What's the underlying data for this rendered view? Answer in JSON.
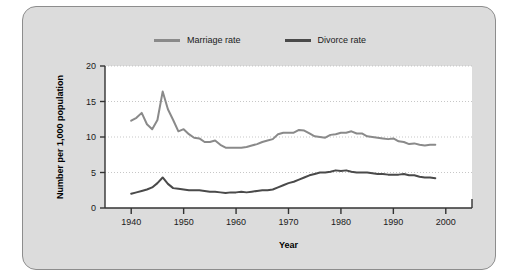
{
  "chart_data": {
    "type": "line",
    "title": "",
    "xlabel": "Year",
    "ylabel": "Number per 1,000 population",
    "xlim": [
      1935,
      2005
    ],
    "ylim": [
      0,
      20
    ],
    "xticks": [
      1940,
      1950,
      1960,
      1970,
      1980,
      1990,
      2000
    ],
    "yticks": [
      0,
      5,
      10,
      15,
      20
    ],
    "grid": "horizontal-dotted",
    "legend_position": "top-center",
    "series": [
      {
        "name": "Marriage rate",
        "color": "#8a8a8a",
        "x": [
          1940,
          1941,
          1942,
          1943,
          1944,
          1945,
          1946,
          1947,
          1948,
          1949,
          1950,
          1951,
          1952,
          1953,
          1954,
          1955,
          1956,
          1957,
          1958,
          1959,
          1960,
          1961,
          1962,
          1963,
          1964,
          1965,
          1966,
          1967,
          1968,
          1969,
          1970,
          1971,
          1972,
          1973,
          1974,
          1975,
          1976,
          1977,
          1978,
          1979,
          1980,
          1981,
          1982,
          1983,
          1984,
          1985,
          1986,
          1987,
          1988,
          1989,
          1990,
          1991,
          1992,
          1993,
          1994,
          1995,
          1996,
          1997,
          1998
        ],
        "values": [
          12.3,
          12.7,
          13.4,
          11.8,
          11.1,
          12.4,
          16.4,
          13.9,
          12.4,
          10.8,
          11.1,
          10.4,
          9.9,
          9.8,
          9.3,
          9.3,
          9.5,
          8.9,
          8.5,
          8.5,
          8.5,
          8.5,
          8.6,
          8.8,
          9.0,
          9.3,
          9.5,
          9.7,
          10.4,
          10.6,
          10.6,
          10.6,
          11.0,
          10.9,
          10.5,
          10.1,
          10.0,
          9.9,
          10.3,
          10.4,
          10.6,
          10.6,
          10.8,
          10.5,
          10.5,
          10.1,
          10.0,
          9.9,
          9.8,
          9.7,
          9.8,
          9.4,
          9.3,
          9.0,
          9.1,
          8.9,
          8.8,
          8.9,
          8.9
        ]
      },
      {
        "name": "Divorce rate",
        "color": "#4a4a4a",
        "x": [
          1940,
          1941,
          1942,
          1943,
          1944,
          1945,
          1946,
          1947,
          1948,
          1949,
          1950,
          1951,
          1952,
          1953,
          1954,
          1955,
          1956,
          1957,
          1958,
          1959,
          1960,
          1961,
          1962,
          1963,
          1964,
          1965,
          1966,
          1967,
          1968,
          1969,
          1970,
          1971,
          1972,
          1973,
          1974,
          1975,
          1976,
          1977,
          1978,
          1979,
          1980,
          1981,
          1982,
          1983,
          1984,
          1985,
          1986,
          1987,
          1988,
          1989,
          1990,
          1991,
          1992,
          1993,
          1994,
          1995,
          1996,
          1997,
          1998
        ],
        "values": [
          2.0,
          2.2,
          2.4,
          2.6,
          2.9,
          3.5,
          4.3,
          3.4,
          2.8,
          2.7,
          2.6,
          2.5,
          2.5,
          2.5,
          2.4,
          2.3,
          2.3,
          2.2,
          2.1,
          2.2,
          2.2,
          2.3,
          2.2,
          2.3,
          2.4,
          2.5,
          2.5,
          2.6,
          2.9,
          3.2,
          3.5,
          3.7,
          4.0,
          4.3,
          4.6,
          4.8,
          5.0,
          5.0,
          5.1,
          5.3,
          5.2,
          5.3,
          5.1,
          5.0,
          5.0,
          5.0,
          4.9,
          4.8,
          4.8,
          4.7,
          4.7,
          4.7,
          4.8,
          4.6,
          4.6,
          4.4,
          4.3,
          4.3,
          4.2
        ]
      }
    ]
  },
  "legend": {
    "entries": [
      {
        "label": "Marriage rate"
      },
      {
        "label": "Divorce rate"
      }
    ]
  },
  "axes": {
    "y_title": "Number per 1,000 population",
    "x_title": "Year"
  }
}
